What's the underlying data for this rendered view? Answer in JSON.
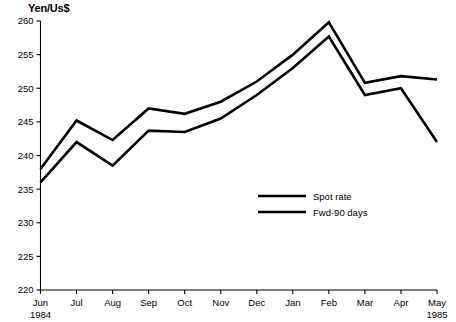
{
  "chart_data": {
    "type": "line",
    "title": "",
    "ylabel": "Yen/Us$",
    "xlabel": "",
    "ylim": [
      220,
      260
    ],
    "yticks": [
      220,
      225,
      230,
      235,
      240,
      245,
      250,
      255,
      260
    ],
    "grid": false,
    "legend_position": "center-right-inside",
    "categories": [
      "Jun",
      "Jul",
      "Aug",
      "Sep",
      "Oct",
      "Nov",
      "Dec",
      "Jan",
      "Feb",
      "Mar",
      "Apr",
      "May"
    ],
    "category_sublabels": [
      "1984",
      "",
      "",
      "",
      "",
      "",
      "",
      "",
      "",
      "",
      "",
      "1985"
    ],
    "series": [
      {
        "name": "Spot rate",
        "values": [
          238.0,
          245.2,
          242.3,
          247.0,
          246.2,
          248.0,
          251.0,
          255.0,
          259.8,
          250.8,
          251.8,
          251.3
        ]
      },
      {
        "name": "Fwd-90 days",
        "values": [
          236.0,
          242.0,
          238.5,
          243.7,
          243.5,
          245.5,
          249.0,
          253.0,
          257.7,
          249.0,
          250.0,
          242.0
        ]
      }
    ],
    "line_color": "#000000"
  },
  "axis": {
    "y_title": "Yen/Us$",
    "y_labels": [
      "260",
      "255",
      "250",
      "245",
      "240",
      "235",
      "230",
      "225",
      "220"
    ],
    "x_labels": [
      "Jun",
      "Jul",
      "Aug",
      "Sep",
      "Oct",
      "Nov",
      "Dec",
      "Jan",
      "Feb",
      "Mar",
      "Apr",
      "May"
    ],
    "x_year_start": "1984",
    "x_year_end": "1985"
  },
  "legend": {
    "entries": [
      {
        "label": "Spot rate"
      },
      {
        "label": "Fwd-90 days"
      }
    ]
  }
}
